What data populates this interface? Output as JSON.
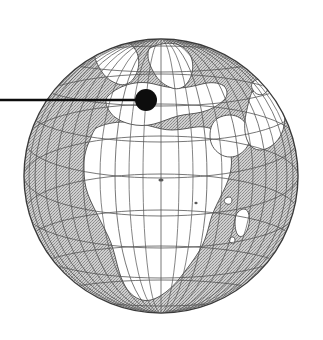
{
  "figure": {
    "kind": "locator-globe-illustration",
    "title": "Orthographic globe locator map",
    "style": "engraved black-and-white line art with stippled ocean shading",
    "background_color": "#ffffff"
  },
  "globe": {
    "center_x": 161,
    "center_y": 176,
    "radius": 137,
    "outline_color": "#3a3a3a",
    "outline_width": 1.4,
    "ocean_fill_color": "#b9b9b9",
    "ocean_texture": "stipple-dither",
    "land_fill_color": "#ffffff",
    "land_outline_color": "#4a4a4a",
    "projection": "orthographic",
    "center_longitude": 14,
    "center_latitude": 18,
    "visible_continents": [
      "Africa",
      "Europe",
      "Asia (western)",
      "Greenland",
      "Arabian Peninsula",
      "Madagascar"
    ],
    "visible_seas": [
      "Atlantic Ocean",
      "Mediterranean Sea",
      "Black Sea",
      "Caspian Sea",
      "Red Sea",
      "Indian Ocean",
      "Arctic Ocean"
    ]
  },
  "graticule": {
    "meridian_spacing_degrees": 15,
    "parallel_spacing_degrees": 15,
    "line_color": "#555555",
    "line_width": 0.8,
    "equator_emphasized": false,
    "grid_visible": true
  },
  "marker": {
    "label": "location-marker",
    "shape": "filled-circle",
    "center_x": 146,
    "center_y": 100,
    "radius": 11,
    "fill_color": "#0d0d0d",
    "approx_longitude": -2,
    "approx_latitude": 48
  },
  "leader_line": {
    "label": "callout-leader-line",
    "x_start": 0,
    "x_end": 146,
    "y": 100,
    "stroke_color": "#0d0d0d",
    "stroke_width": 2.6,
    "orientation": "horizontal"
  },
  "canvas": {
    "width": 323,
    "height": 340
  }
}
